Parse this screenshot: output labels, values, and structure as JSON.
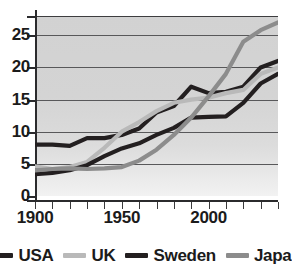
{
  "chart_data": {
    "type": "line",
    "title": "",
    "xlabel": "",
    "ylabel": "",
    "xlim": [
      1900,
      2040
    ],
    "ylim": [
      0,
      28
    ],
    "grid": true,
    "gridlines_y": [
      5,
      10,
      15,
      20,
      25
    ],
    "legend_position": "bottom",
    "y_ticks": [
      "0",
      "5",
      "10",
      "15",
      "20",
      "25"
    ],
    "y_tick_values": [
      0,
      5,
      10,
      15,
      20,
      25
    ],
    "x_ticks": [
      "1900",
      "1950",
      "2000"
    ],
    "x_tick_values": [
      1900,
      1950,
      2000
    ],
    "x_minor_tick_values": [
      1900,
      1910,
      1920,
      1930,
      1940,
      1950,
      1960,
      1970,
      1980,
      1990,
      2000,
      2010,
      2020,
      2030,
      2040
    ],
    "x": [
      1900,
      1910,
      1920,
      1930,
      1940,
      1950,
      1960,
      1970,
      1980,
      1990,
      2000,
      2010,
      2020,
      2030,
      2040
    ],
    "series": [
      {
        "name": "USA",
        "color": "#231f20",
        "values": [
          8.0,
          8.0,
          7.8,
          9.0,
          9.0,
          9.5,
          10.5,
          13.0,
          14.0,
          17.0,
          16.0,
          16.2,
          17.0,
          20.0,
          21.0
        ]
      },
      {
        "name": "UK",
        "color": "#b9b9b9",
        "values": [
          4.6,
          4.2,
          4.5,
          5.3,
          7.5,
          10.0,
          11.5,
          13.2,
          14.5,
          15.0,
          15.3,
          16.0,
          16.5,
          19.0,
          20.0
        ]
      },
      {
        "name": "Sweden",
        "color": "#231f20",
        "values": [
          3.4,
          3.6,
          4.0,
          4.8,
          6.2,
          7.4,
          8.2,
          9.5,
          10.6,
          12.2,
          12.3,
          12.4,
          14.5,
          17.5,
          19.0
        ]
      },
      {
        "name": "Japan",
        "color": "#8c8c8c",
        "values": [
          4.0,
          4.2,
          4.3,
          4.2,
          4.3,
          4.5,
          5.5,
          7.2,
          9.5,
          12.2,
          15.5,
          19.0,
          24.0,
          25.8,
          27.0
        ]
      }
    ]
  },
  "legend": {
    "items": [
      {
        "label": "USA",
        "color": "#231f20",
        "icon": "line-swatch-usa"
      },
      {
        "label": "UK",
        "color": "#b9b9b9",
        "icon": "line-swatch-uk"
      },
      {
        "label": "Sweden",
        "color": "#231f20",
        "icon": "line-swatch-sweden"
      },
      {
        "label": "Japan",
        "color": "#8c8c8c",
        "icon": "line-swatch-japan"
      }
    ]
  },
  "colors": {
    "plot_background_top": "#d2d2d2",
    "plot_background_bottom": "#f2f2f2",
    "gridline": "#58585a",
    "axis": "#2b2b2d",
    "text": "#1b1b1b"
  }
}
